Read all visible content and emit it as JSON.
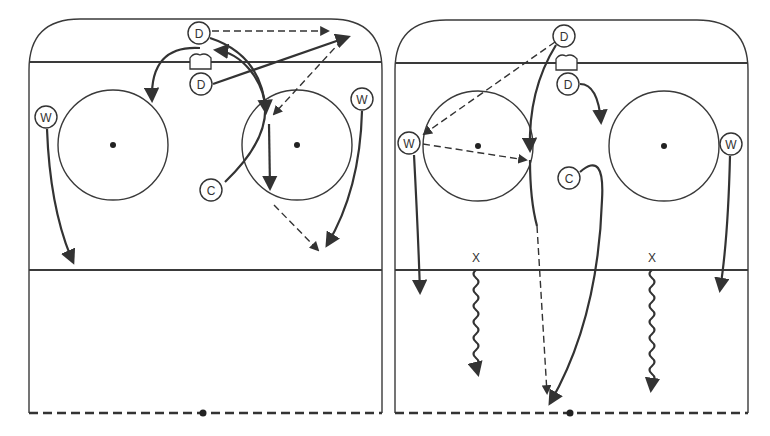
{
  "diagram": {
    "type": "hockey-drill",
    "panels": [
      {
        "id": "left",
        "players": [
          {
            "label": "D",
            "x": 199,
            "y": 33
          },
          {
            "label": "D",
            "x": 201,
            "y": 84
          },
          {
            "label": "W",
            "x": 46,
            "y": 117
          },
          {
            "label": "W",
            "x": 362,
            "y": 99
          },
          {
            "label": "C",
            "x": 211,
            "y": 190
          }
        ],
        "x_marks": []
      },
      {
        "id": "right",
        "players": [
          {
            "label": "D",
            "x": 564,
            "y": 36
          },
          {
            "label": "D",
            "x": 568,
            "y": 84
          },
          {
            "label": "W",
            "x": 409,
            "y": 143
          },
          {
            "label": "W",
            "x": 731,
            "y": 144
          },
          {
            "label": "C",
            "x": 569,
            "y": 178
          }
        ],
        "x_marks": [
          {
            "label": "X",
            "x": 476,
            "y": 262
          },
          {
            "label": "X",
            "x": 652,
            "y": 262
          }
        ]
      }
    ],
    "legend": {
      "solid_arrow": "skate",
      "dashed_arrow": "pass",
      "wavy_arrow": "skate with puck",
      "x": "cone / starting point"
    }
  }
}
